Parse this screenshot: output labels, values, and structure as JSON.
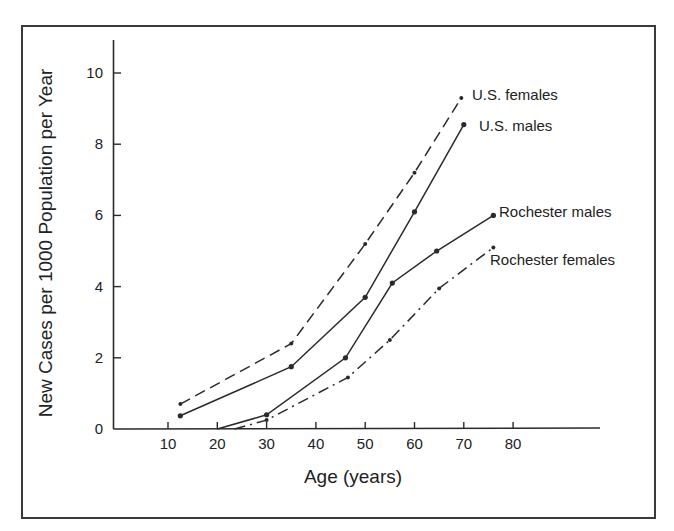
{
  "chart_data": {
    "type": "line",
    "title": "",
    "xlabel": "Age (years)",
    "ylabel": "New Cases per 1000 Population per Year",
    "xlim": [
      0,
      90
    ],
    "ylim": [
      0,
      11
    ],
    "x_ticks": [
      10,
      20,
      30,
      40,
      50,
      60,
      70,
      80
    ],
    "y_ticks": [
      0,
      2,
      4,
      6,
      8,
      10
    ],
    "grid": false,
    "legend": "inline labels at line ends",
    "series": [
      {
        "name": "U.S. females",
        "style": "dashed",
        "x": [
          12.5,
          35,
          50,
          60,
          69.5
        ],
        "y": [
          0.7,
          2.4,
          5.2,
          7.2,
          9.3
        ],
        "label_pos": [
          472,
          100
        ]
      },
      {
        "name": "U.S. males",
        "style": "solid",
        "x": [
          12.5,
          35,
          50,
          60,
          70
        ],
        "y": [
          0.37,
          1.75,
          3.7,
          6.1,
          8.55
        ],
        "label_pos": [
          479,
          131
        ]
      },
      {
        "name": "Rochester males",
        "style": "solid",
        "x": [
          20,
          30,
          46,
          55.5,
          64.5,
          76
        ],
        "y": [
          0,
          0.4,
          2.0,
          4.1,
          5.0,
          6.0
        ],
        "label_pos": [
          499,
          217
        ]
      },
      {
        "name": "Rochester females",
        "style": "dash-dot",
        "x": [
          23.5,
          30,
          46.5,
          55,
          65,
          76
        ],
        "y": [
          0,
          0.25,
          1.45,
          2.5,
          3.95,
          5.1
        ],
        "label_pos": [
          490,
          265
        ]
      }
    ]
  },
  "axes": {
    "x_title": "Age (years)",
    "y_title": "New Cases per 1000 Population per Year"
  },
  "colors": {
    "line": "#2a2a2a",
    "frame": "#3a3a3a",
    "text": "#222222",
    "background": "#ffffff"
  }
}
